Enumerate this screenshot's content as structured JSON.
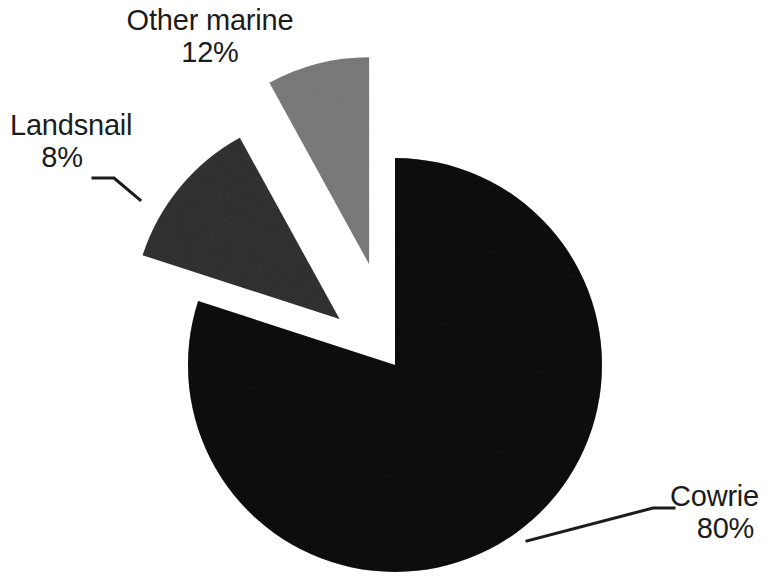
{
  "chart_data": {
    "type": "pie",
    "title": "",
    "subtitle": "",
    "xlabel": "",
    "ylabel": "",
    "legend_position": "none",
    "grid": false,
    "exploded": true,
    "label_format": "name + percent",
    "categories": [
      "Cowrie",
      "Other marine",
      "Landsnail"
    ],
    "values": [
      80,
      12,
      8
    ],
    "unit": "%",
    "total": 100,
    "slices": [
      {
        "name": "Cowrie",
        "percent": 80,
        "percent_label": "80%",
        "color": "#404040",
        "start_angle_deg": 0,
        "sweep_deg": 288,
        "exploded": false,
        "leader_line": true
      },
      {
        "name": "Other marine",
        "percent": 12,
        "percent_label": "12%",
        "color": "#707070",
        "start_angle_deg": 288,
        "sweep_deg": 43.2,
        "exploded": true,
        "leader_line": false
      },
      {
        "name": "Landsnail",
        "percent": 8,
        "percent_label": "8%",
        "color": "#b0b0b0",
        "start_angle_deg": 331.2,
        "sweep_deg": 28.8,
        "exploded": true,
        "leader_line": true
      }
    ]
  },
  "labels": {
    "other_marine": {
      "name": "Other marine",
      "percent": "12%"
    },
    "landsnail": {
      "name": "Landsnail",
      "percent": "8%"
    },
    "cowrie": {
      "name": "Cowrie",
      "percent": "80%"
    }
  },
  "colors": {
    "background": "#ffffff",
    "text": "#1c1c1c",
    "leader_line": "#1c1c1c",
    "cowrie": "#404040",
    "other_marine": "#707070",
    "landsnail": "#b0b0b0"
  }
}
